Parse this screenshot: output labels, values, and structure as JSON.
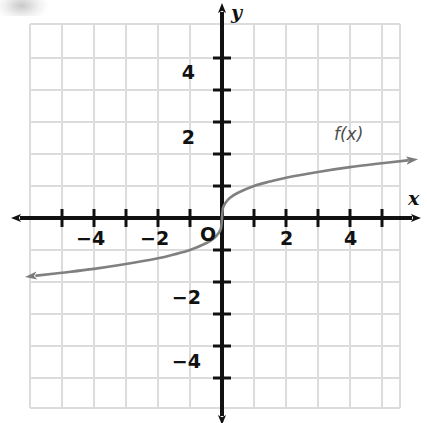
{
  "chart_data": {
    "type": "line",
    "title": "",
    "subtitle": "",
    "xlabel": "x",
    "ylabel": "y",
    "xlim": [
      -5.6,
      5.6
    ],
    "ylim": [
      -5.6,
      5.6
    ],
    "grid": true,
    "grid_step": 1,
    "legend": "none",
    "origin_label": "O",
    "x_ticks": [
      -5,
      -4,
      -3,
      -2,
      -1,
      0,
      1,
      2,
      3,
      4,
      5
    ],
    "y_ticks": [
      -5,
      -4,
      -3,
      -2,
      -1,
      0,
      1,
      2,
      3,
      4,
      5
    ],
    "x_tick_labels": [
      {
        "value": -4,
        "text": "−4"
      },
      {
        "value": -2,
        "text": "−2"
      },
      {
        "value": 2,
        "text": "2"
      },
      {
        "value": 4,
        "text": "4"
      }
    ],
    "y_tick_labels": [
      {
        "value": 4,
        "text": "4"
      },
      {
        "value": 2,
        "text": "2"
      },
      {
        "value": -2,
        "text": "−2"
      },
      {
        "value": -4,
        "text": "−4"
      }
    ],
    "annotations": [
      {
        "text": "f(x)",
        "x": 4.0,
        "y": 2.55
      }
    ],
    "series": [
      {
        "name": "f(x)",
        "equation": "cube root of x",
        "arrow_start": true,
        "arrow_end": true,
        "color": "#808080",
        "x": [
          -5.8,
          -5.0,
          -4.0,
          -3.0,
          -2.0,
          -1.5,
          -1.0,
          -0.5,
          -0.25,
          -0.1,
          -0.03,
          0,
          0.03,
          0.1,
          0.25,
          0.5,
          1.0,
          1.5,
          2.0,
          3.0,
          4.0,
          5.0,
          5.8
        ],
        "y": [
          -1.8,
          -1.71,
          -1.59,
          -1.44,
          -1.26,
          -1.14,
          -1.0,
          -0.79,
          -0.63,
          -0.46,
          -0.31,
          0,
          0.31,
          0.46,
          0.63,
          0.79,
          1.0,
          1.14,
          1.26,
          1.44,
          1.59,
          1.71,
          1.8
        ]
      }
    ]
  },
  "axes": {
    "x_axis_name": "x",
    "y_axis_name": "y",
    "x_axis_arrows": "both",
    "y_axis_arrows": "both"
  },
  "colors": {
    "grid": "#dcdcdc",
    "axis": "#111111",
    "curve": "#808080",
    "text": "#111111",
    "background": "#ffffff"
  }
}
